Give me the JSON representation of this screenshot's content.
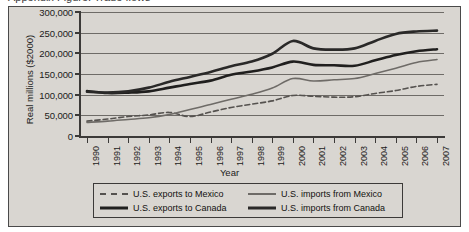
{
  "top_partial_text": "Appendix Figure: Trade flows",
  "figure": {
    "background_color": "#d9d6d1",
    "border_color": "#4a4a4a"
  },
  "chart_data": {
    "type": "line",
    "title": "",
    "xlabel": "Year",
    "ylabel": "Real millions ($2000)",
    "ylim": [
      0,
      300000
    ],
    "ytick_values": [
      0,
      50000,
      100000,
      150000,
      200000,
      250000,
      300000
    ],
    "ytick_labels": [
      "0",
      "50,000",
      "100,000",
      "150,000",
      "200,000",
      "250,000",
      "300,000"
    ],
    "grid": true,
    "grid_axis": "y",
    "legend_position": "bottom",
    "x": [
      1990,
      1991,
      1992,
      1993,
      1994,
      1995,
      1996,
      1997,
      1998,
      1999,
      2000,
      2001,
      2002,
      2003,
      2004,
      2005,
      2006,
      2007
    ],
    "xtick_labels": [
      "1990",
      "1991",
      "1992",
      "1993",
      "1994",
      "1995",
      "1996",
      "1997",
      "1998",
      "1999",
      "2000",
      "2001",
      "2002",
      "2003",
      "2004",
      "2005",
      "2006",
      "2007"
    ],
    "series": [
      {
        "name": "U.S. exports to Mexico",
        "style": "dashed",
        "color": "#55524f",
        "width": 1.6,
        "values": [
          36000,
          41000,
          47000,
          51000,
          57000,
          47000,
          58000,
          69000,
          77000,
          85000,
          98000,
          96000,
          94000,
          95000,
          103000,
          110000,
          120000,
          125000
        ]
      },
      {
        "name": "U.S. imports from Mexico",
        "style": "solid",
        "color": "#6e6b67",
        "width": 1.6,
        "values": [
          33000,
          36000,
          40000,
          44000,
          52000,
          64000,
          76000,
          89000,
          101000,
          116000,
          139000,
          133000,
          136000,
          139000,
          151000,
          164000,
          178000,
          185000
        ]
      },
      {
        "name": "U.S. exports to Canada",
        "style": "solid",
        "color": "#201f1e",
        "width": 2.6,
        "values": [
          109000,
          104000,
          105000,
          108000,
          117000,
          126000,
          134000,
          148000,
          156000,
          166000,
          180000,
          172000,
          171000,
          170000,
          183000,
          196000,
          205000,
          210000
        ]
      },
      {
        "name": "U.S. imports from Canada",
        "style": "solid",
        "color": "#2a2928",
        "width": 2.6,
        "values": [
          107000,
          105000,
          108000,
          117000,
          131000,
          143000,
          155000,
          169000,
          180000,
          199000,
          230000,
          212000,
          209000,
          212000,
          230000,
          247000,
          253000,
          255000
        ]
      }
    ]
  },
  "legend": {
    "items": [
      {
        "label": "U.S. exports to Mexico",
        "style": "dashed",
        "color": "#55524f",
        "width": 1.6
      },
      {
        "label": "U.S. imports from Mexico",
        "style": "solid",
        "color": "#6e6b67",
        "width": 1.6
      },
      {
        "label": "U.S. exports to Canada",
        "style": "solid",
        "color": "#201f1e",
        "width": 2.6
      },
      {
        "label": "U.S. imports from Canada",
        "style": "solid",
        "color": "#2a2928",
        "width": 2.6
      }
    ]
  }
}
